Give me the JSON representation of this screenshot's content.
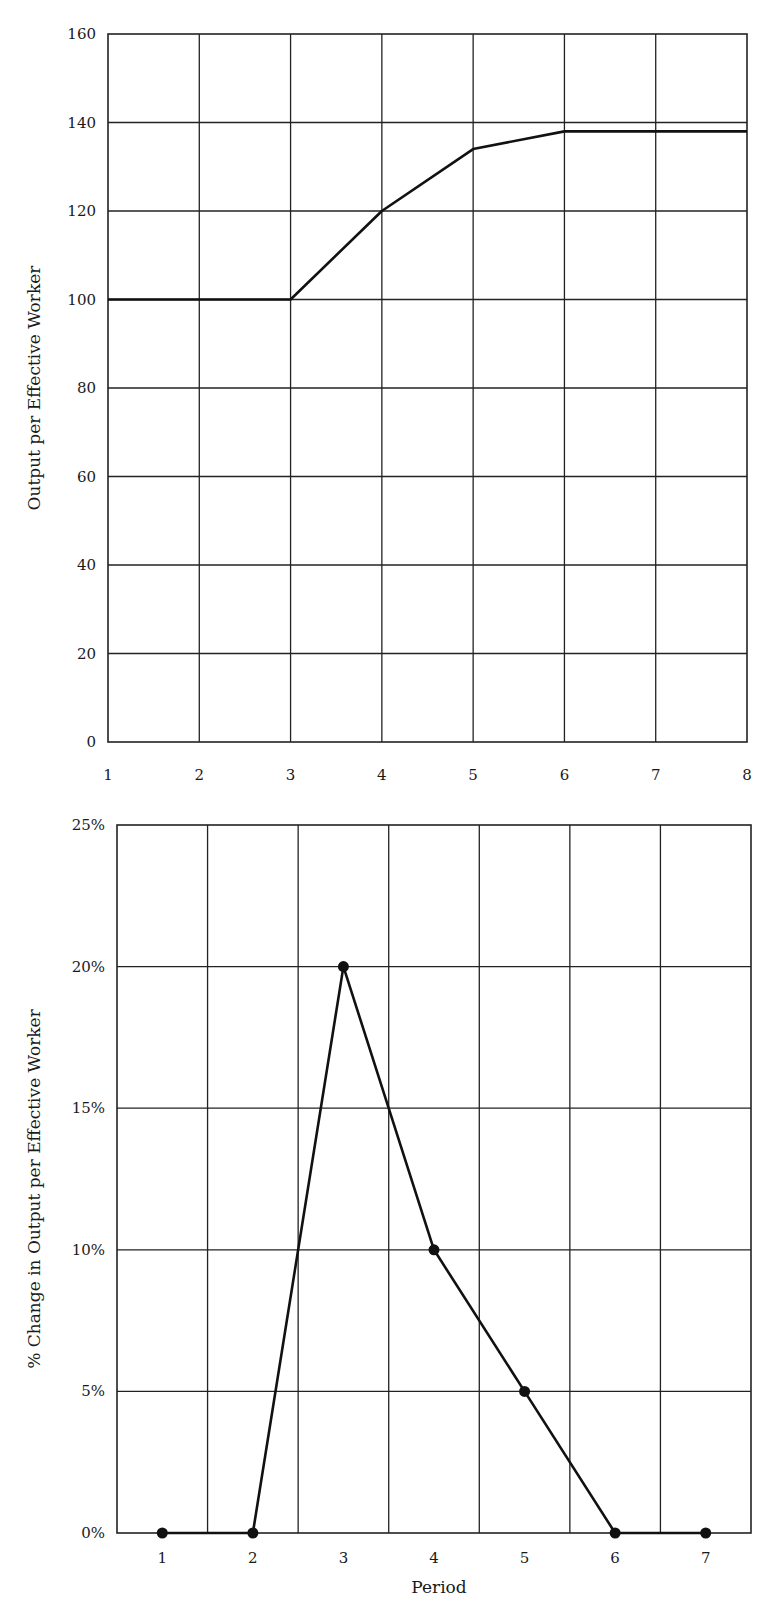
{
  "chart_data": [
    {
      "type": "line",
      "title": "",
      "xlabel": "",
      "ylabel": "Output per Effective Worker",
      "x": [
        1,
        2,
        3,
        4,
        5,
        6,
        7,
        8
      ],
      "x_tick_labels": [
        "1",
        "2",
        "3",
        "4",
        "5",
        "6",
        "7",
        "8"
      ],
      "y_tick_labels": [
        "0",
        "20",
        "40",
        "60",
        "80",
        "100",
        "120",
        "140",
        "160"
      ],
      "ylim": [
        0,
        160
      ],
      "xlim": [
        1,
        8
      ],
      "grid": true,
      "markers": false,
      "series": [
        {
          "name": "Output per Effective Worker",
          "values": [
            100,
            100,
            100,
            120,
            134,
            138,
            138,
            138
          ]
        }
      ]
    },
    {
      "type": "line",
      "title": "",
      "xlabel": "Period",
      "ylabel": "% Change in Output per Effective Worker",
      "x": [
        1,
        2,
        3,
        4,
        5,
        6,
        7
      ],
      "x_tick_labels": [
        "1",
        "2",
        "3",
        "4",
        "5",
        "6",
        "7"
      ],
      "y_tick_labels": [
        "0%",
        "5%",
        "10%",
        "15%",
        "20%",
        "25%"
      ],
      "ylim": [
        0,
        25
      ],
      "grid": true,
      "markers": true,
      "series": [
        {
          "name": "% Change",
          "values": [
            0,
            0,
            20,
            10,
            5,
            0,
            0
          ]
        }
      ]
    }
  ]
}
